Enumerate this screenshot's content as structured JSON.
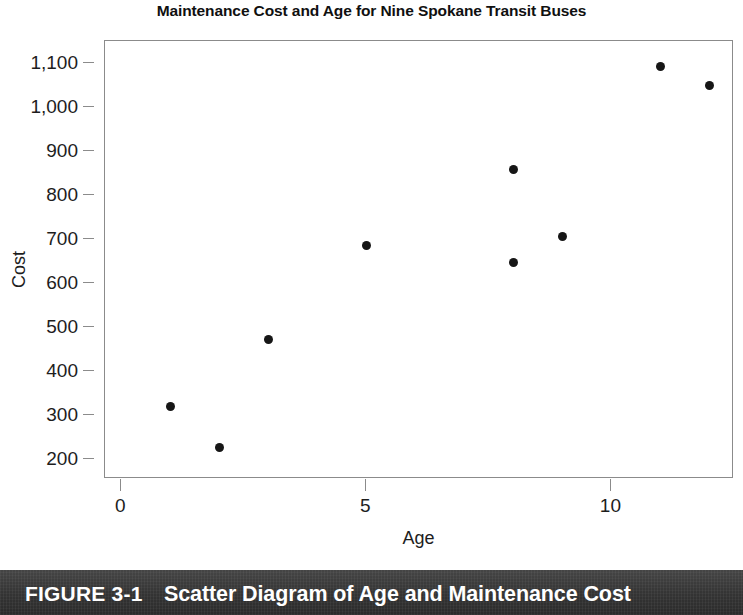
{
  "chart_data": {
    "type": "scatter",
    "title": "Maintenance Cost and Age for Nine Spokane Transit Buses",
    "xlabel": "Age",
    "ylabel": "Cost",
    "xlim": [
      -0.33,
      12.5
    ],
    "ylim": [
      155,
      1150
    ],
    "grid": false,
    "legend": null,
    "x_ticks": [
      0,
      5,
      10
    ],
    "x_tick_labels": [
      "0",
      "5",
      "10"
    ],
    "y_ticks": [
      200,
      300,
      400,
      500,
      600,
      700,
      800,
      900,
      1000,
      1100
    ],
    "y_tick_labels": [
      "200",
      "300",
      "400",
      "500",
      "600",
      "700",
      "800",
      "900",
      "1,000",
      "1,100"
    ],
    "point_color": "#161616",
    "frame_color": "#8b8b8b",
    "points": [
      {
        "x": 1,
        "y": 320
      },
      {
        "x": 2,
        "y": 227
      },
      {
        "x": 3,
        "y": 473
      },
      {
        "x": 5,
        "y": 685
      },
      {
        "x": 8,
        "y": 858
      },
      {
        "x": 8,
        "y": 647
      },
      {
        "x": 9,
        "y": 705
      },
      {
        "x": 11,
        "y": 1093
      },
      {
        "x": 12,
        "y": 1048
      }
    ]
  },
  "caption": {
    "figure_number": "FIGURE 3-1",
    "figure_label": "Scatter Diagram of Age and Maintenance Cost",
    "band_color": "#3a3a3a",
    "text_color": "#ffffff"
  }
}
